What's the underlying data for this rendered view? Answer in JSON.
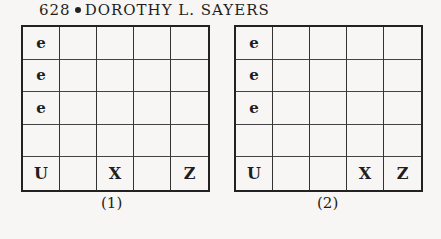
{
  "header": {
    "page_number": "628",
    "author": "DOROTHY L. SAYERS"
  },
  "grids": [
    {
      "caption": "(1)",
      "rows": [
        [
          "e",
          "",
          "",
          "",
          ""
        ],
        [
          "e",
          "",
          "",
          "",
          ""
        ],
        [
          "e",
          "",
          "",
          "",
          ""
        ],
        [
          "",
          "",
          "",
          "",
          ""
        ],
        [
          "U",
          "",
          "X",
          "",
          "Z"
        ]
      ]
    },
    {
      "caption": "(2)",
      "rows": [
        [
          "e",
          "",
          "",
          "",
          ""
        ],
        [
          "e",
          "",
          "",
          "",
          ""
        ],
        [
          "e",
          "",
          "",
          "",
          ""
        ],
        [
          "",
          "",
          "",
          "",
          ""
        ],
        [
          "U",
          "",
          "",
          "X",
          "Z"
        ]
      ]
    }
  ]
}
